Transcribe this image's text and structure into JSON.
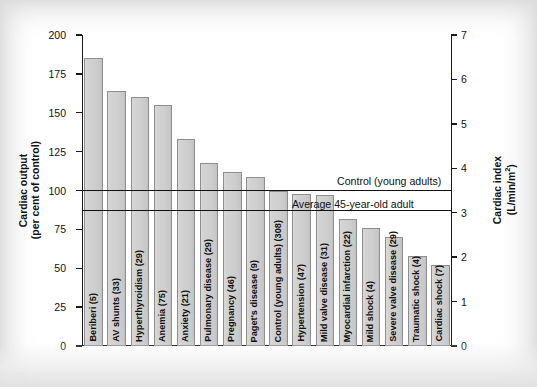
{
  "figure": {
    "left_axis_title_line1": "Cardiac output",
    "left_axis_title_line2": "(per cent of control)",
    "right_axis_title_line1": "Cardiac index",
    "right_axis_title_line2": "(L/min/m",
    "right_axis_title_sup": "2",
    "right_axis_title_close": ")"
  },
  "annotations": [
    {
      "name": "control-line",
      "label": "Control (young adults)",
      "value": 100
    },
    {
      "name": "average-45-line",
      "label": "Average 45-year-old adult",
      "value": 87
    }
  ],
  "chart_data": {
    "type": "bar",
    "title": "",
    "xlabel": "",
    "ylabel": "Cardiac output (per cent of control)",
    "ylim": [
      0,
      200
    ],
    "yticks": [
      0,
      25,
      50,
      75,
      100,
      125,
      150,
      175,
      200
    ],
    "y2label": "Cardiac index (L/min/m2)",
    "y2lim": [
      0,
      7
    ],
    "y2ticks": [
      0,
      1,
      2,
      3,
      4,
      5,
      6,
      7
    ],
    "grid": false,
    "legend": "none",
    "categories": [
      "Beriberi (5)",
      "AV shunts (33)",
      "Hyperthyroidism (29)",
      "Anemia (75)",
      "Anxiety (21)",
      "Pulmonary disease (29)",
      "Pregnancy (46)",
      "Paget's disease (9)",
      "Control (young adults) (308)",
      "Hypertension (47)",
      "Mild valve disease (31)",
      "Myocardial infarction (22)",
      "Mild shock (4)",
      "Severe valve disease (29)",
      "Traumatic shock (4)",
      "Cardiac shock (7)"
    ],
    "values": [
      185,
      164,
      160,
      155,
      133,
      118,
      112,
      109,
      100,
      98,
      97,
      82,
      76,
      70,
      58,
      52
    ],
    "reference_lines": [
      {
        "label": "Control (young adults)",
        "value": 100
      },
      {
        "label": "Average 45-year-old adult",
        "value": 87
      }
    ]
  }
}
